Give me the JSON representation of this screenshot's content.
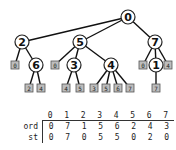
{
  "tree": {
    "internal_nodes": [
      {
        "id": "0",
        "label": "0"
      },
      {
        "id": "2",
        "label": "2"
      },
      {
        "id": "5",
        "label": "5"
      },
      {
        "id": "7",
        "label": "7"
      },
      {
        "id": "6",
        "label": "6"
      },
      {
        "id": "3",
        "label": "3"
      },
      {
        "id": "4",
        "label": "4"
      },
      {
        "id": "1",
        "label": "1"
      }
    ],
    "leaf_boxes": [
      {
        "id": "l2a",
        "parent": "2",
        "label": "0"
      },
      {
        "id": "l5a",
        "parent": "5",
        "label": "0"
      },
      {
        "id": "l7a",
        "parent": "7",
        "label": "0"
      },
      {
        "id": "l7b",
        "parent": "7",
        "label": "4"
      },
      {
        "id": "l6a",
        "parent": "6",
        "label": "2"
      },
      {
        "id": "l6b",
        "parent": "6",
        "label": "4"
      },
      {
        "id": "l3a",
        "parent": "3",
        "label": "4"
      },
      {
        "id": "l3b",
        "parent": "3",
        "label": "5"
      },
      {
        "id": "l4a",
        "parent": "4",
        "label": "3"
      },
      {
        "id": "l4b",
        "parent": "4",
        "label": "5"
      },
      {
        "id": "l4c",
        "parent": "4",
        "label": "6"
      },
      {
        "id": "l4d",
        "parent": "4",
        "label": "7"
      },
      {
        "id": "l1a",
        "parent": "1",
        "label": "7"
      }
    ],
    "edges": [
      [
        "0",
        "2"
      ],
      [
        "0",
        "5"
      ],
      [
        "0",
        "7"
      ],
      [
        "2",
        "l2a"
      ],
      [
        "2",
        "6"
      ],
      [
        "5",
        "l5a"
      ],
      [
        "5",
        "3"
      ],
      [
        "5",
        "4"
      ],
      [
        "7",
        "l7a"
      ],
      [
        "7",
        "1"
      ],
      [
        "7",
        "l7b"
      ],
      [
        "6",
        "l6a"
      ],
      [
        "6",
        "l6b"
      ],
      [
        "3",
        "l3a"
      ],
      [
        "3",
        "l3b"
      ],
      [
        "4",
        "l4a"
      ],
      [
        "4",
        "l4b"
      ],
      [
        "4",
        "l4c"
      ],
      [
        "4",
        "l4d"
      ],
      [
        "1",
        "l1a"
      ]
    ]
  },
  "table": {
    "header": [
      "0",
      "1",
      "2",
      "3",
      "4",
      "5",
      "6",
      "7"
    ],
    "rows": [
      {
        "label": "ord",
        "values": [
          "0",
          "7",
          "1",
          "5",
          "6",
          "2",
          "4",
          "3"
        ]
      },
      {
        "label": "st",
        "values": [
          "0",
          "7",
          "0",
          "5",
          "5",
          "0",
          "2",
          "0"
        ]
      }
    ]
  }
}
